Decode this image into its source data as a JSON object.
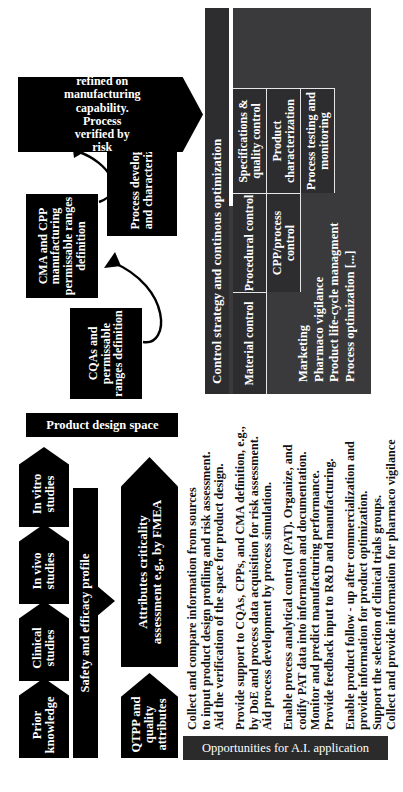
{
  "colors": {
    "box": "#000000",
    "control_panel": "#3a3a3c",
    "control_dark": "#2d2d2f",
    "header_bar": "#2b2b2b",
    "body_text": "#111111",
    "background": "#ffffff"
  },
  "left_column": {
    "inputs": [
      {
        "label": "Prior knowledge"
      },
      {
        "label": "Clinical studies"
      },
      {
        "label": "In vivo studies"
      },
      {
        "label": "In vitro studies"
      }
    ],
    "safety_profile": "Safety and efficacy profile",
    "qtpp": "QTPP and quality attributes",
    "criticality": "Attributes criticality assessment e.g., by FMEA",
    "product_design_space": "Product design space"
  },
  "flow": {
    "cqa": "CQAs and permissable ranges definition",
    "cma_cpp": "CMA and CPP manufacturing permissable ranges definition",
    "process_dev": "Process development and characterization",
    "design_space_refined": "Design space refined on manufacturing capability. Process verified by risk assessment"
  },
  "control_strategy": {
    "title": "Control strategy and continous optimization",
    "cells": [
      {
        "label": "Material control"
      },
      {
        "label": "Procedural control"
      },
      {
        "label": "Specifications & quality control"
      },
      {
        "label": "CPP/process control"
      },
      {
        "label": "Product characterization"
      },
      {
        "label": "Process testing and monitoring"
      }
    ],
    "lifecycle_items": [
      "Marketing",
      "Pharmaco vigilance",
      "Product life-cycle managment",
      "Process optimization [...]"
    ]
  },
  "ai_opportunities": {
    "header": "Opportunities for A.I. application",
    "paragraphs": [
      [
        "Collect and compare information from sources",
        "to input product design profiling and risk assessment.",
        "Aid the verification of the space for product design."
      ],
      [
        "Provide support to CQAs, CPPs, and CMA definition, e.g.,",
        "by DoE and process data acquisition for risk assessment.",
        "Aid process development by process simulation."
      ],
      [
        "Enable process analytical control (PAT). Organize, and",
        "codify PAT data into information and documentation.",
        "Monitor and predict manufacturing performance.",
        "Provide feedback input to R&D and manufacturing."
      ],
      [
        "Enable product follow - up after commercialization and",
        "provide information for product optimization.",
        "Support the  selection of clinical trials groups.",
        "Collect and provide information for pharmaco vigilance"
      ]
    ]
  }
}
